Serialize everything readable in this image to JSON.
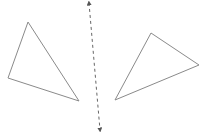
{
  "diagram": {
    "colors": {
      "background": "#ffffff",
      "stroke": "#8a8a8a",
      "axis": "#555555"
    },
    "shapes": [
      {
        "id": "triangle-left",
        "type": "triangle",
        "points": [
          [
            28,
            22
          ],
          [
            8,
            78
          ],
          [
            79,
            101
          ]
        ]
      },
      {
        "id": "triangle-right",
        "type": "triangle",
        "points": [
          [
            151,
            33
          ],
          [
            199,
            65
          ],
          [
            115,
            100
          ]
        ]
      }
    ],
    "reflection_line": {
      "style": "dashed",
      "arrows": "both",
      "from": [
        89,
        3
      ],
      "to": [
        100,
        130
      ]
    }
  }
}
